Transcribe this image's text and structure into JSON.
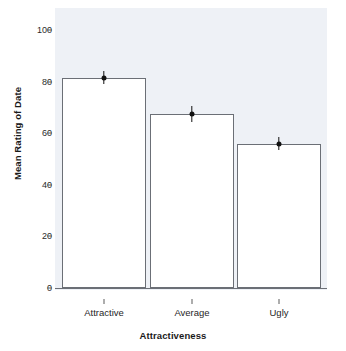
{
  "chart_data": {
    "type": "bar",
    "title": "",
    "subtitle": "",
    "xlabel": "Attractiveness",
    "ylabel": "Mean Rating of Date",
    "categories": [
      "Attractive",
      "Average",
      "Ugly"
    ],
    "values": [
      81.5,
      67.5,
      56
    ],
    "errors": [
      2.5,
      3,
      2.5
    ],
    "series": [
      {
        "name": "Mean Rating of Date",
        "values": [
          81.5,
          67.5,
          56
        ]
      }
    ],
    "ylim": [
      0,
      105
    ],
    "yticks": [
      0,
      20,
      40,
      60,
      80,
      100
    ],
    "ytick_labels": [
      "0",
      "20",
      "40",
      "60",
      "80",
      "100"
    ],
    "xtick_labels": [
      "Attractive",
      "Average",
      "Ugly"
    ],
    "grid": false,
    "legend": false,
    "legend_position": "none",
    "bar_fill_color": "#ffffff",
    "bar_border_color": "#6b6f76",
    "errorbar_color": "#111111",
    "panel_background_color": "#eef1f6",
    "figure_background_color": "#ffffff"
  }
}
